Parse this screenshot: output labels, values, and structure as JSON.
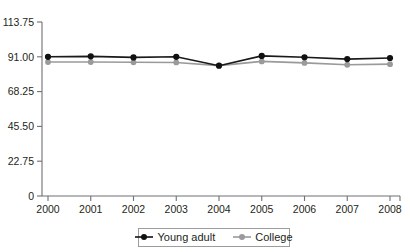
{
  "chart_data": {
    "type": "line",
    "title": "",
    "subtitle": "",
    "xlabel": "",
    "ylabel": "",
    "x": [
      2000,
      2001,
      2002,
      2003,
      2004,
      2005,
      2006,
      2007,
      2008
    ],
    "xtick_labels": [
      "2000",
      "2001",
      "2002",
      "2003",
      "2004",
      "2005",
      "2006",
      "2007",
      "2008"
    ],
    "ytick_labels": [
      "0",
      "22.75",
      "45.50",
      "68.25",
      "91.00",
      "113.75"
    ],
    "ytick_values": [
      0,
      22.75,
      45.5,
      68.25,
      91,
      113.75
    ],
    "ylim": [
      0,
      113.75
    ],
    "xlim": [
      2000,
      2008
    ],
    "grid": false,
    "legend_position": "bottom-center",
    "series": [
      {
        "name": "Young adult",
        "color": "#111111",
        "marker": "circle",
        "values": [
          91.0,
          91.3,
          90.6,
          91.0,
          85.2,
          91.6,
          90.7,
          89.5,
          90.2
        ]
      },
      {
        "name": "College",
        "color": "#9a9a9a",
        "marker": "circle",
        "values": [
          87.6,
          87.6,
          87.4,
          87.3,
          85.2,
          88.0,
          87.0,
          85.8,
          86.2
        ]
      }
    ],
    "annotations": []
  },
  "legend": {
    "entries": [
      {
        "label": "Young adult",
        "color": "#111111"
      },
      {
        "label": "College",
        "color": "#9a9a9a"
      }
    ]
  },
  "colors": {
    "axis": "#6f7072",
    "text": "#231f20",
    "primary_series": "#111111",
    "secondary_series": "#9a9a9a",
    "legend_border": "#9c9c9c",
    "background": "#ffffff"
  }
}
